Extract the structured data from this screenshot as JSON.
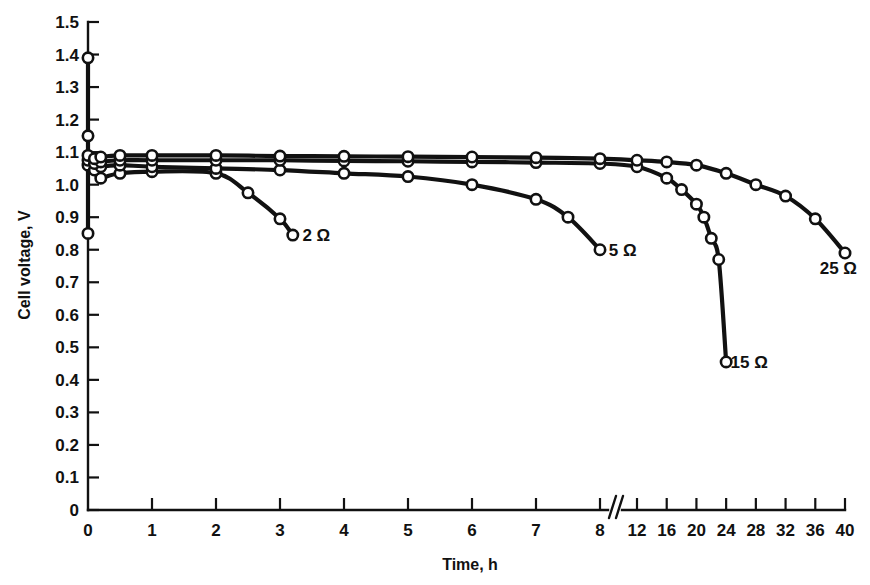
{
  "chart_data": {
    "type": "line",
    "title": "",
    "xlabel": "Time, h",
    "ylabel": "Cell voltage, V",
    "ylim": [
      0,
      1.5
    ],
    "grid": false,
    "legend_position": "inline-end-of-curve",
    "y_ticks": [
      "0",
      "0.1",
      "0.2",
      "0.3",
      "0.4",
      "0.5",
      "0.6",
      "0.7",
      "0.8",
      "0.9",
      "1.0",
      "1.1",
      "1.2",
      "1.3",
      "1.4",
      "1.5"
    ],
    "y_tick_values": [
      0,
      0.1,
      0.2,
      0.3,
      0.4,
      0.5,
      0.6,
      0.7,
      0.8,
      0.9,
      1.0,
      1.1,
      1.2,
      1.3,
      1.4,
      1.5
    ],
    "x_ticks": [
      "0",
      "1",
      "2",
      "3",
      "4",
      "5",
      "6",
      "7",
      "8",
      "12",
      "16",
      "20",
      "24",
      "28",
      "32",
      "36",
      "40"
    ],
    "x_tick_values": [
      0,
      1,
      2,
      3,
      4,
      5,
      6,
      7,
      8,
      12,
      16,
      20,
      24,
      28,
      32,
      36,
      40
    ],
    "axis_break": {
      "after": 8,
      "before": 12,
      "symbol": "//"
    },
    "series": [
      {
        "name": "2 Ω",
        "label": "2 Ω",
        "label_x": 3.35,
        "label_y": 0.845,
        "x": [
          0,
          0.05,
          0.1,
          0.2,
          0.5,
          1,
          2,
          2.5,
          3,
          3.2
        ],
        "y": [
          1.39,
          1.15,
          0.85,
          1.02,
          1.035,
          1.04,
          1.035,
          0.975,
          0.895,
          0.845
        ]
      },
      {
        "name": "5 Ω",
        "label": "5 Ω",
        "label_x": 8.2,
        "label_y": 0.8,
        "x": [
          0,
          0.1,
          0.2,
          0.5,
          1,
          2,
          3,
          4,
          5,
          6,
          7,
          7.5,
          8
        ],
        "y": [
          1.06,
          1.045,
          1.055,
          1.06,
          1.055,
          1.05,
          1.045,
          1.035,
          1.025,
          1.0,
          0.955,
          0.9,
          0.8
        ]
      },
      {
        "name": "15 Ω",
        "label": "15 Ω",
        "label_x": 24.6,
        "label_y": 0.455,
        "x": [
          0,
          0.1,
          0.2,
          0.5,
          1,
          2,
          3,
          4,
          5,
          6,
          7,
          8,
          12,
          16,
          18,
          20,
          21,
          22,
          23,
          24
        ],
        "y": [
          1.075,
          1.065,
          1.07,
          1.075,
          1.075,
          1.075,
          1.075,
          1.073,
          1.072,
          1.07,
          1.068,
          1.065,
          1.055,
          1.02,
          0.985,
          0.94,
          0.9,
          0.835,
          0.77,
          0.455
        ]
      },
      {
        "name": "25 Ω",
        "label": "25 Ω",
        "label_x": 36.6,
        "label_y": 0.745,
        "x": [
          0,
          0.1,
          0.2,
          0.5,
          1,
          2,
          3,
          4,
          5,
          6,
          7,
          8,
          12,
          16,
          20,
          24,
          28,
          32,
          36,
          40
        ],
        "y": [
          1.09,
          1.08,
          1.085,
          1.09,
          1.09,
          1.09,
          1.088,
          1.087,
          1.086,
          1.085,
          1.083,
          1.08,
          1.075,
          1.07,
          1.06,
          1.035,
          1.0,
          0.965,
          0.895,
          0.79
        ]
      }
    ],
    "startup_transient": {
      "x": 0,
      "y_top": 1.39,
      "y_bottom": 0.85,
      "marker_points": [
        1.39,
        1.15,
        0.85
      ]
    },
    "colors": {
      "line": "#111111",
      "marker_fill": "#ffffff",
      "background": "#ffffff"
    }
  }
}
